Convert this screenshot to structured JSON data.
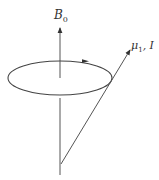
{
  "diagram": {
    "type": "vector precession diagram",
    "colors": {
      "stroke": "#4a4a4a",
      "text": "#333333",
      "background": "#ffffff"
    },
    "axis": {
      "label_main": "B",
      "label_sub": "0",
      "from": [
        60,
        175
      ],
      "to": [
        60,
        27
      ]
    },
    "precession_orbit": {
      "center": [
        60,
        78
      ],
      "rx": 52,
      "ry": 17,
      "direction_arrow": {
        "at": [
          86,
          61
        ],
        "direction": "right"
      }
    },
    "moment_vector": {
      "label_main": "μ",
      "label_sub": "1",
      "label_extra": ", I",
      "from": [
        61,
        164
      ],
      "to": [
        130,
        50
      ]
    }
  }
}
